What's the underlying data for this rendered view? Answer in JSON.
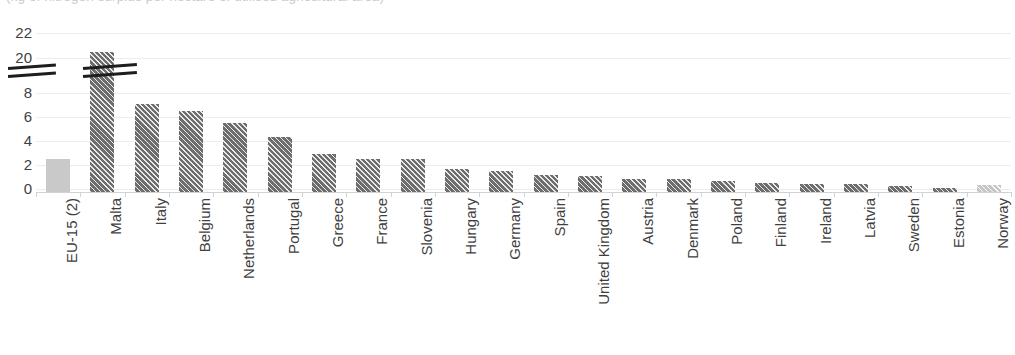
{
  "chart_data": {
    "type": "bar",
    "title": "(kg of nitrogen surplus per hectare of utilised agricultural area)",
    "xlabel": "",
    "ylabel": "",
    "ylim": [
      0,
      22
    ],
    "grid": true,
    "legend": "none",
    "axis_break": {
      "present": true,
      "lower_top": 8,
      "upper_bottom": 20,
      "note": "y-axis is broken between 8 and 20; Malta's bar is also broken"
    },
    "ytick_labels": [
      "22",
      "20",
      "8",
      "6",
      "4",
      "2",
      "0"
    ],
    "ytick_values": [
      22,
      20,
      8,
      6,
      4,
      2,
      0
    ],
    "categories": [
      "EU-15 (2)",
      "Malta",
      "Italy",
      "Belgium",
      "Netherlands",
      "Portugal",
      "Greece",
      "France",
      "Slovenia",
      "Hungary",
      "Germany",
      "Spain",
      "United Kingdom",
      "Austria",
      "Denmark",
      "Poland",
      "Finland",
      "Ireland",
      "Latvia",
      "Sweden",
      "Estonia",
      "Norway"
    ],
    "values": [
      2.5,
      20.5,
      7.1,
      6.5,
      5.5,
      4.3,
      2.9,
      2.5,
      2.5,
      1.7,
      1.5,
      1.2,
      1.1,
      0.8,
      0.8,
      0.7,
      0.5,
      0.45,
      0.4,
      0.25,
      0.1,
      0.3
    ],
    "series": [
      {
        "name": "Nitrogen surplus",
        "values": [
          2.5,
          20.5,
          7.1,
          6.5,
          5.5,
          4.3,
          2.9,
          2.5,
          2.5,
          1.7,
          1.5,
          1.2,
          1.1,
          0.8,
          0.8,
          0.7,
          0.5,
          0.45,
          0.4,
          0.25,
          0.1,
          0.3
        ]
      }
    ],
    "bar_styles": [
      "plain-light",
      "hatched",
      "hatched",
      "hatched",
      "hatched",
      "hatched",
      "hatched",
      "hatched",
      "hatched",
      "hatched",
      "hatched",
      "hatched",
      "hatched",
      "hatched",
      "hatched",
      "hatched",
      "hatched",
      "hatched",
      "hatched",
      "hatched",
      "hatched",
      "hatched-light"
    ],
    "colors": {
      "bar_primary": "#6d6d6d",
      "bar_aggregate": "#c9c9c9",
      "bar_non_eu": "#c6c6c6",
      "gridline": "#ececed",
      "text": "#3f3f3f",
      "axis": "#d2d2d3",
      "break_mark": "#1d1d1d"
    }
  }
}
